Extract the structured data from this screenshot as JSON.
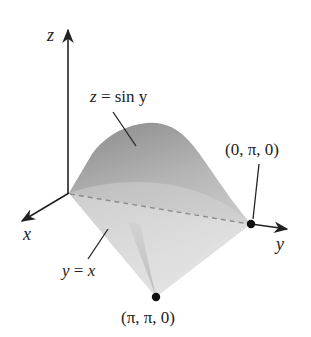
{
  "figure": {
    "type": "3d-surface-diagram"
  },
  "axes": {
    "x_label": "x",
    "y_label": "y",
    "z_label": "z"
  },
  "labels": {
    "surface_eq_lhs": "z",
    "surface_eq_eq": "=",
    "surface_eq_rhs": "sin y",
    "surface_equation": "z = sin y",
    "plane_eq_lhs": "y",
    "plane_eq_eq": "=",
    "plane_eq_rhs": "x",
    "plane_equation": "y = x",
    "point_a": "(0, π, 0)",
    "point_b": "(π, π, 0)"
  },
  "points": [
    {
      "name": "origin",
      "coords": "(0, 0, 0)",
      "labeled": false
    },
    {
      "name": "point_a",
      "coords": "(0, π, 0)",
      "labeled": true
    },
    {
      "name": "point_b",
      "coords": "(π, π, 0)",
      "labeled": true
    }
  ],
  "colors": {
    "axis": "#222222",
    "surface_dark": "#8e8e8e",
    "surface_mid": "#bdbdbd",
    "surface_light": "#e6e6e6",
    "dashed_line": "#8a8a8a",
    "point": "#111111"
  }
}
